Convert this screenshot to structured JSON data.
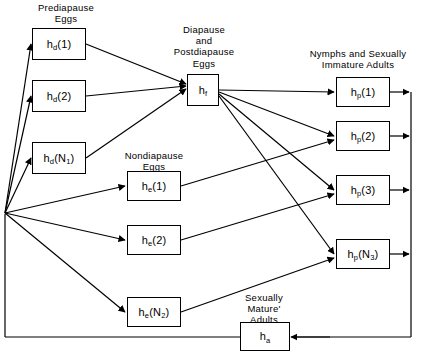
{
  "diagram": {
    "title_visible": false,
    "group_labels": [
      {
        "id": "prediapause",
        "text": "Prediapause\nEggs"
      },
      {
        "id": "diapause",
        "text": "Diapause\nand\nPostdiapause\nEggs"
      },
      {
        "id": "nondiapause",
        "text": "Nondiapause\nEggs"
      },
      {
        "id": "nymphs",
        "text": "Nymphs and Sexually\nImmature Adults"
      },
      {
        "id": "sexually_mature",
        "text": "Sexually\nMature'\nAdults"
      }
    ],
    "nodes": [
      {
        "id": "hd1",
        "base": "h",
        "sub": "d",
        "arg": "(1)",
        "label": "h_d(1)"
      },
      {
        "id": "hd2",
        "base": "h",
        "sub": "d",
        "arg": "(2)",
        "label": "h_d(2)"
      },
      {
        "id": "hdN1",
        "base": "h",
        "sub": "d",
        "arg": "(N_1)",
        "label": "h_d(N_1)"
      },
      {
        "id": "hf",
        "base": "h",
        "sub": "f",
        "arg": "",
        "label": "h_f"
      },
      {
        "id": "he1",
        "base": "h",
        "sub": "e",
        "arg": "(1)",
        "label": "h_e(1)"
      },
      {
        "id": "he2",
        "base": "h",
        "sub": "e",
        "arg": "(2)",
        "label": "h_e(2)"
      },
      {
        "id": "heN2",
        "base": "h",
        "sub": "e",
        "arg": "(N_2)",
        "label": "h_e(N_2)"
      },
      {
        "id": "hp1",
        "base": "h",
        "sub": "p",
        "arg": "(1)",
        "label": "h_p(1)"
      },
      {
        "id": "hp2",
        "base": "h",
        "sub": "p",
        "arg": "(2)",
        "label": "h_p(2)"
      },
      {
        "id": "hp3",
        "base": "h",
        "sub": "p",
        "arg": "(3)",
        "label": "h_p(3)"
      },
      {
        "id": "hpN3",
        "base": "h",
        "sub": "p",
        "arg": "(N_3)",
        "label": "h_p(N_3)"
      },
      {
        "id": "ha",
        "base": "h",
        "sub": "a",
        "arg": "",
        "label": "h_a"
      }
    ],
    "colors": {
      "stroke": "#000000",
      "background": "#ffffff"
    }
  }
}
